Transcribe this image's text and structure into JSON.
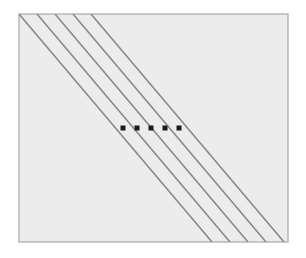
{
  "figure": {
    "type": "geometric-diagram",
    "canvas": {
      "width": 306,
      "height": 258
    },
    "background_color": "#ffffff",
    "frame": {
      "label": "figure border",
      "x": 19,
      "y": 14,
      "width": 269,
      "height": 228,
      "fill_color": "#ececec",
      "stroke_color": "#b4b4b4",
      "stroke_width": 1.4
    },
    "lines": {
      "label": "parallel diagonal lines",
      "count": 5,
      "slope": -1,
      "angle_degrees": -45,
      "stroke_color": "#8a8a8a",
      "stroke_width": 1.6,
      "spacing_px": 18,
      "items": [
        {
          "id": "line-1",
          "x1": 19,
          "y1": 14,
          "x2": 212,
          "y2": 242
        },
        {
          "id": "line-2",
          "x1": 37,
          "y1": 14,
          "x2": 230,
          "y2": 242
        },
        {
          "id": "line-3",
          "x1": 55,
          "y1": 14,
          "x2": 248,
          "y2": 242
        },
        {
          "id": "line-4",
          "x1": 73,
          "y1": 14,
          "x2": 266,
          "y2": 242
        },
        {
          "id": "line-5",
          "x1": 91,
          "y1": 14,
          "x2": 284,
          "y2": 242
        }
      ]
    },
    "points": {
      "label": "marked points on lines",
      "count": 5,
      "color": "#1a1a1a",
      "size_px": 5,
      "shape": "square",
      "row_y": 128,
      "spacing_px": 14,
      "items": [
        {
          "id": "point-1",
          "on_line": "line-1",
          "cx": 123,
          "cy": 128
        },
        {
          "id": "point-2",
          "on_line": "line-2",
          "cx": 137,
          "cy": 128
        },
        {
          "id": "point-3",
          "on_line": "line-3",
          "cx": 151,
          "cy": 128
        },
        {
          "id": "point-4",
          "on_line": "line-4",
          "cx": 165,
          "cy": 128
        },
        {
          "id": "point-5",
          "on_line": "line-5",
          "cx": 179,
          "cy": 128
        }
      ]
    }
  }
}
